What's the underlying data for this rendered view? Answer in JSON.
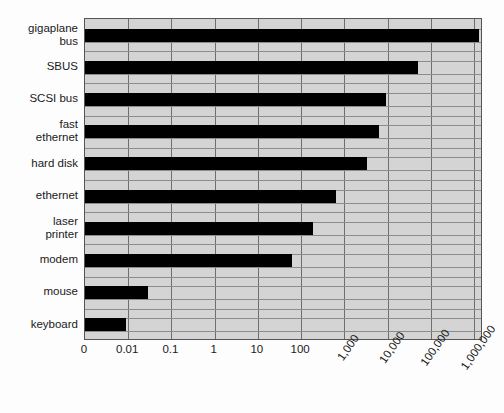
{
  "chart_data": {
    "type": "bar",
    "orientation": "horizontal",
    "title": "",
    "xlabel": "",
    "ylabel": "",
    "xscale": "log",
    "grid": true,
    "legend": null,
    "plot_background_color": "#d4d4d4",
    "bar_color": "#000000",
    "gridline_color": "#6e6e6e",
    "xtick_labels": [
      "0",
      "0.01",
      "0.1",
      "1",
      "10",
      "100",
      "1,000",
      "10,000",
      "100,000",
      "1,000,000"
    ],
    "xtick_values": [
      0,
      0.01,
      0.1,
      1,
      10,
      100,
      1000,
      10000,
      100000,
      1000000
    ],
    "xtick_rotated": [
      false,
      false,
      false,
      false,
      false,
      false,
      true,
      true,
      true,
      true
    ],
    "categories": [
      "gigaplane\nbus",
      "SBUS",
      "SCSI bus",
      "fast\nethernet",
      "hard disk",
      "ethernet",
      "laser\nprinter",
      "modem",
      "mouse",
      "keyboard"
    ],
    "values": [
      2000000,
      100000,
      10000,
      7000,
      3000,
      350,
      90,
      28,
      0.04,
      0.01
    ],
    "bar_end_fraction": [
      0.99,
      0.836,
      0.756,
      0.738,
      0.708,
      0.63,
      0.573,
      0.52,
      0.158,
      0.103
    ]
  }
}
